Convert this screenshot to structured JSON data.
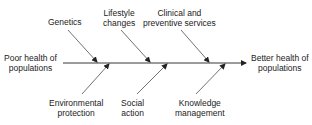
{
  "diagram": {
    "type": "fishbone",
    "problem": "Poor health of populations",
    "outcome": "Better health of populations",
    "problem_lines": [
      "Poor health of",
      "populations"
    ],
    "outcome_lines": [
      "Better health of",
      "populations"
    ],
    "top_causes": [
      {
        "label": "Genetics",
        "lines": [
          "Genetics"
        ]
      },
      {
        "label": "Lifestyle changes",
        "lines": [
          "Lifestyle",
          "changes"
        ]
      },
      {
        "label": "Clinical and preventive services",
        "lines": [
          "Clinical and",
          "preventive services"
        ]
      }
    ],
    "bottom_causes": [
      {
        "label": "Environmental protection",
        "lines": [
          "Environmental",
          "protection"
        ]
      },
      {
        "label": "Social action",
        "lines": [
          "Social",
          "action"
        ]
      },
      {
        "label": "Knowledge management",
        "lines": [
          "Knowledge",
          "management"
        ]
      }
    ],
    "line_color": "#222222"
  }
}
